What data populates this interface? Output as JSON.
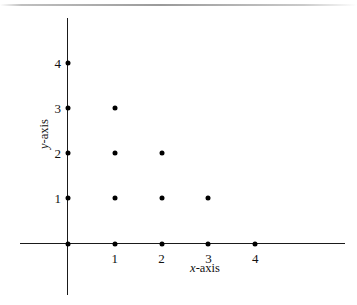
{
  "chart_data": {
    "type": "scatter",
    "title": "",
    "xlabel": "x-axis",
    "ylabel": "y-axis",
    "x": [
      0,
      0,
      0,
      0,
      0,
      1,
      1,
      1,
      1,
      2,
      2,
      2,
      3,
      3,
      4
    ],
    "y": [
      0,
      1,
      2,
      3,
      4,
      0,
      1,
      2,
      3,
      0,
      1,
      2,
      0,
      1,
      0
    ],
    "points": [
      {
        "x": 0,
        "y": 0
      },
      {
        "x": 0,
        "y": 1
      },
      {
        "x": 0,
        "y": 2
      },
      {
        "x": 0,
        "y": 3
      },
      {
        "x": 0,
        "y": 4
      },
      {
        "x": 1,
        "y": 0
      },
      {
        "x": 1,
        "y": 1
      },
      {
        "x": 1,
        "y": 2
      },
      {
        "x": 1,
        "y": 3
      },
      {
        "x": 2,
        "y": 0
      },
      {
        "x": 2,
        "y": 1
      },
      {
        "x": 2,
        "y": 2
      },
      {
        "x": 3,
        "y": 0
      },
      {
        "x": 3,
        "y": 1
      },
      {
        "x": 4,
        "y": 0
      }
    ],
    "xticks": [
      1,
      2,
      3,
      4
    ],
    "yticks": [
      1,
      2,
      3,
      4
    ],
    "xtick_labels": [
      "1",
      "2",
      "3",
      "4"
    ],
    "ytick_labels": [
      "1",
      "2",
      "3",
      "4"
    ],
    "xlim": [
      -1.0,
      5.9
    ],
    "ylim": [
      -1.1,
      5.0
    ],
    "grid": false,
    "legend": null,
    "marker_color": "#000000",
    "axis_color": "#1a1a1a",
    "background_color": "#ffffff"
  },
  "axis_titles": {
    "x_prefix": "x",
    "x_suffix": "-axis",
    "y_prefix": "y",
    "y_suffix": "-axis"
  }
}
